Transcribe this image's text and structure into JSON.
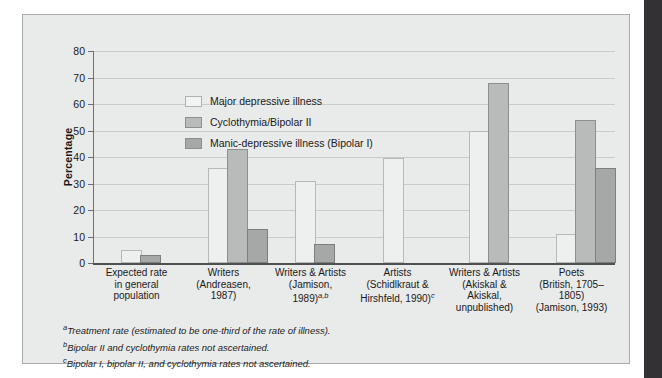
{
  "chart_data": {
    "type": "bar",
    "title": "",
    "xlabel": "",
    "ylabel": "Percentage",
    "ylim": [
      0,
      80
    ],
    "yticks": [
      0,
      10,
      20,
      30,
      40,
      50,
      60,
      70,
      80
    ],
    "grid": true,
    "legend_position": "top-left inside plot",
    "categories": [
      "Expected rate in general population",
      "Writers (Andreasen, 1987)",
      "Writers & Artists (Jamison, 1989)",
      "Artists (Schidlkraut & Hirshfeld, 1990)",
      "Writers & Artists (Akiskal & Akiskal, unpublished)",
      "Poets (British, 1705–1805) (Jamison, 1993)"
    ],
    "series": [
      {
        "name": "Major depressive illness",
        "color": "#eeefef",
        "values": [
          5,
          36,
          31,
          39.5,
          50,
          11
        ]
      },
      {
        "name": "Cyclothymia/Bipolar II",
        "color": "#b9bbbb",
        "values": [
          null,
          43,
          null,
          null,
          68,
          54
        ]
      },
      {
        "name": "Manic-depressive illness (Bipolar I)",
        "color": "#a6a8a8",
        "values": [
          3,
          13,
          7,
          null,
          null,
          36
        ]
      }
    ]
  },
  "legend": {
    "items": [
      {
        "label": "Major depressive illness"
      },
      {
        "label": "Cyclothymia/Bipolar II"
      },
      {
        "label": "Manic-depressive illness (Bipolar I)"
      }
    ]
  },
  "yaxis": {
    "title": "Percentage",
    "ticks": [
      "80",
      "70",
      "60",
      "50",
      "40",
      "30",
      "20",
      "10",
      "0"
    ]
  },
  "xaxis": {
    "labels": [
      {
        "lines": [
          "Expected rate",
          "in general",
          "population"
        ],
        "sup": ""
      },
      {
        "lines": [
          "Writers",
          "(Andreasen,",
          "1987)"
        ],
        "sup": ""
      },
      {
        "lines": [
          "Writers & Artists",
          "(Jamison,",
          "1989)"
        ],
        "sup": "a,b"
      },
      {
        "lines": [
          "Artists",
          "(Schidlkraut &",
          "Hirshfeld, 1990)"
        ],
        "sup": "c"
      },
      {
        "lines": [
          "Writers & Artists",
          "(Akiskal &",
          "Akiskal,",
          "unpublished)"
        ],
        "sup": ""
      },
      {
        "lines": [
          "Poets",
          "(British, 1705–1805)",
          "(Jamison, 1993)"
        ],
        "sup": ""
      }
    ]
  },
  "footnotes": [
    {
      "marker": "a",
      "text": "Treatment rate (estimated to be one-third of the rate of illness)."
    },
    {
      "marker": "b",
      "text": "Bipolar II and cyclothymia rates not ascertained."
    },
    {
      "marker": "c",
      "text": "Bipolar I, bipolar II, and cyclothymia rates not ascertained."
    }
  ]
}
